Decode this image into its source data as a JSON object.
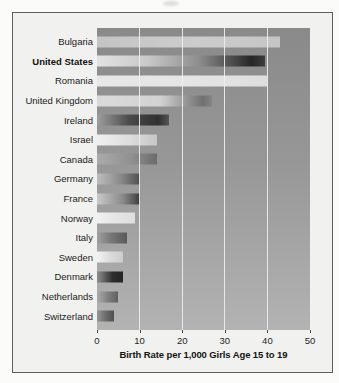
{
  "figure": {
    "page_background": "#fbfbf9",
    "frame_background": "#f1f1ef",
    "frame_border_color": "#5e5e5e",
    "plot_bg_top": "#8a8a8a",
    "plot_bg_bottom": "#b3b3b3",
    "gridline_color": "rgba(240,240,240,0.9)"
  },
  "chart_data": {
    "type": "bar",
    "orientation": "horizontal",
    "title": "",
    "xlabel": "Birth Rate per 1,000 Girls Age 15 to 19",
    "ylabel": "",
    "xlim": [
      0,
      50
    ],
    "x_ticks": [
      "0",
      "10",
      "20",
      "30",
      "40",
      "50"
    ],
    "x_tick_values": [
      0,
      10,
      20,
      30,
      40,
      50
    ],
    "grid": "vertical light gridlines drawn over bars",
    "legend": "none",
    "highlight_category": "United States",
    "categories": [
      "Bulgaria",
      "United States",
      "Romania",
      "United Kingdom",
      "Ireland",
      "Israel",
      "Canada",
      "Germany",
      "France",
      "Norway",
      "Italy",
      "Sweden",
      "Denmark",
      "Netherlands",
      "Switzerland"
    ],
    "values": [
      43,
      39.5,
      40,
      27,
      17,
      14,
      14,
      10,
      10,
      9,
      7,
      6,
      6,
      5,
      4
    ],
    "bar_gradients": [
      [
        [
          "#c4c4c4",
          0
        ],
        [
          "#cccccc",
          55
        ],
        [
          "#c5c5c5",
          100
        ]
      ],
      [
        [
          "#e3e3e3",
          0
        ],
        [
          "#c9c9c9",
          30
        ],
        [
          "#8f8f8f",
          60
        ],
        [
          "#262626",
          92
        ],
        [
          "#3d3d3d",
          100
        ]
      ],
      [
        [
          "#e8e8e8",
          0
        ],
        [
          "#e4e4e4",
          60
        ],
        [
          "#dedede",
          100
        ]
      ],
      [
        [
          "#dadada",
          0
        ],
        [
          "#d2d2d2",
          55
        ],
        [
          "#707070",
          92
        ],
        [
          "#858585",
          100
        ]
      ],
      [
        [
          "#9e9e9e",
          0
        ],
        [
          "#4a4a4a",
          45
        ],
        [
          "#303030",
          85
        ],
        [
          "#555555",
          100
        ]
      ],
      [
        [
          "#f0f0f0",
          0
        ],
        [
          "#dcdcdc",
          55
        ],
        [
          "#c6c6c6",
          100
        ]
      ],
      [
        [
          "#ababab",
          0
        ],
        [
          "#8f8f8f",
          60
        ],
        [
          "#6a6a6a",
          100
        ]
      ],
      [
        [
          "#bdbdbd",
          0
        ],
        [
          "#8a8a8a",
          55
        ],
        [
          "#4f4f4f",
          100
        ]
      ],
      [
        [
          "#c9c9c9",
          0
        ],
        [
          "#8a8a8a",
          60
        ],
        [
          "#3c3c3c",
          100
        ]
      ],
      [
        [
          "#f1f1f1",
          0
        ],
        [
          "#e4e4e4",
          55
        ],
        [
          "#dedede",
          100
        ]
      ],
      [
        [
          "#a0a0a0",
          0
        ],
        [
          "#757575",
          50
        ],
        [
          "#5a5a5a",
          100
        ]
      ],
      [
        [
          "#f3f3f3",
          0
        ],
        [
          "#d9d9d9",
          55
        ],
        [
          "#cccccc",
          100
        ]
      ],
      [
        [
          "#8f8f8f",
          0
        ],
        [
          "#2d2d2d",
          60
        ],
        [
          "#242424",
          100
        ]
      ],
      [
        [
          "#ababab",
          0
        ],
        [
          "#7d7d7d",
          55
        ],
        [
          "#5f5f5f",
          100
        ]
      ],
      [
        [
          "#969696",
          0
        ],
        [
          "#6a6a6a",
          55
        ],
        [
          "#4f4f4f",
          100
        ]
      ]
    ]
  }
}
